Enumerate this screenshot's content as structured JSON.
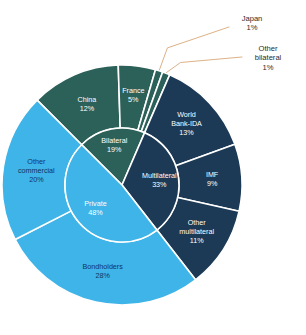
{
  "chart_data": {
    "type": "pie",
    "variant": "sunburst-two-level",
    "title": "",
    "subtitle": "",
    "xlabel": "",
    "ylabel": "",
    "legend": "none",
    "grid": false,
    "units": "percent",
    "center": {
      "x": 122,
      "y": 185
    },
    "radii": {
      "inner_hole": 0,
      "inner_ring_outer": 57,
      "outer_ring_outer": 120
    },
    "start_angle_deg": -45,
    "direction": "clockwise",
    "inner_ring": {
      "categories": [
        "Bilateral",
        "Multilateral",
        "Private"
      ],
      "values": [
        19,
        33,
        48
      ],
      "colors": [
        "#2c6159",
        "#1c3a55",
        "#3eb4e8"
      ],
      "label_colors": [
        "#ffffff",
        "#ffffff",
        "#12355b"
      ]
    },
    "outer_ring": {
      "categories": [
        "China",
        "France",
        "Japan",
        "Other bilateral",
        "World Bank-IDA",
        "IMF",
        "Other multilateral",
        "Bondholders",
        "Other commercial"
      ],
      "values": [
        12,
        5,
        1,
        1,
        13,
        9,
        11,
        28,
        20
      ],
      "colors": [
        "#2c6159",
        "#2c6159",
        "#2c6159",
        "#2c6159",
        "#1c3a55",
        "#1c3a55",
        "#1c3a55",
        "#3eb4e8",
        "#3eb4e8"
      ],
      "parents": [
        "Bilateral",
        "Bilateral",
        "Bilateral",
        "Bilateral",
        "Multilateral",
        "Multilateral",
        "Multilateral",
        "Private",
        "Private"
      ]
    },
    "slice_labels": {
      "bilateral": {
        "name": "Bilateral",
        "pct": "19%"
      },
      "multilateral": {
        "name": "Multilateral",
        "pct": "33%"
      },
      "private": {
        "name": "Private",
        "pct": "48%"
      },
      "china": {
        "name": "China",
        "pct": "12%"
      },
      "france": {
        "name": "France",
        "pct": "5%"
      },
      "japan": {
        "name": "Japan",
        "pct": "1%"
      },
      "other_bilateral": {
        "name": "Other bilateral",
        "pct": "1%"
      },
      "world_bank_ida": {
        "name": "World Bank-IDA",
        "pct": "13%"
      },
      "imf": {
        "name": "IMF",
        "pct": "9%"
      },
      "other_multilateral": {
        "name": "Other multilateral",
        "pct": "11%"
      },
      "bondholders": {
        "name": "Bondholders",
        "pct": "28%"
      },
      "other_commercial": {
        "name": "Other commercial",
        "pct": "20%"
      }
    },
    "callouts": [
      {
        "id": "japan",
        "line1": "Japan",
        "line2": "1%"
      },
      {
        "id": "other-bilateral",
        "line1": "Other",
        "line2": "bilateral",
        "line3": "1%"
      }
    ],
    "colors": {
      "green": "#2c6159",
      "navy": "#1c3a55",
      "light_blue": "#3eb4e8",
      "separator": "#ffffff",
      "leader_line": "#d8a878",
      "background": "#ffffff",
      "dark_text": "#12355b",
      "callout_text": "#2b2b2b"
    }
  }
}
